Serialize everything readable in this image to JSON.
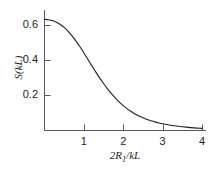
{
  "chart_data": {
    "type": "line",
    "title": "",
    "subtitle": "",
    "xlabel": "2R₁/kL",
    "ylabel": "S(kL)",
    "xlim": [
      0,
      4.1
    ],
    "ylim": [
      0,
      0.685
    ],
    "grid": false,
    "legend": null,
    "x_ticks": [
      1,
      2,
      3,
      4
    ],
    "x_tick_labels": [
      "1",
      "2",
      "3",
      "4"
    ],
    "y_ticks": [
      0.2,
      0.4,
      0.6
    ],
    "y_tick_labels": [
      "0.2",
      "0.4",
      "0.6"
    ],
    "series": [
      {
        "name": "S(kL)",
        "color": "#231f20",
        "x": [
          0.0,
          0.1,
          0.2,
          0.3,
          0.4,
          0.5,
          0.6,
          0.7,
          0.8,
          0.9,
          1.0,
          1.1,
          1.2,
          1.3,
          1.4,
          1.5,
          1.6,
          1.7,
          1.8,
          1.9,
          2.0,
          2.1,
          2.2,
          2.3,
          2.4,
          2.5,
          2.6,
          2.7,
          2.8,
          2.9,
          3.0,
          3.2,
          3.4,
          3.6,
          3.8,
          4.0
        ],
        "y": [
          0.632,
          0.63,
          0.625,
          0.616,
          0.603,
          0.586,
          0.564,
          0.538,
          0.508,
          0.476,
          0.441,
          0.405,
          0.369,
          0.333,
          0.299,
          0.267,
          0.237,
          0.209,
          0.184,
          0.161,
          0.141,
          0.123,
          0.108,
          0.094,
          0.082,
          0.072,
          0.063,
          0.056,
          0.049,
          0.043,
          0.038,
          0.03,
          0.024,
          0.019,
          0.015,
          0.012
        ]
      }
    ]
  },
  "axis_titles": {
    "y": "S(kL)",
    "x_prefix": "2R",
    "x_subscript": "1",
    "x_suffix": "/kL"
  },
  "colors": {
    "background": "#ffffff",
    "ink": "#231f20",
    "axis": "#58595b",
    "curve": "#231f20"
  }
}
